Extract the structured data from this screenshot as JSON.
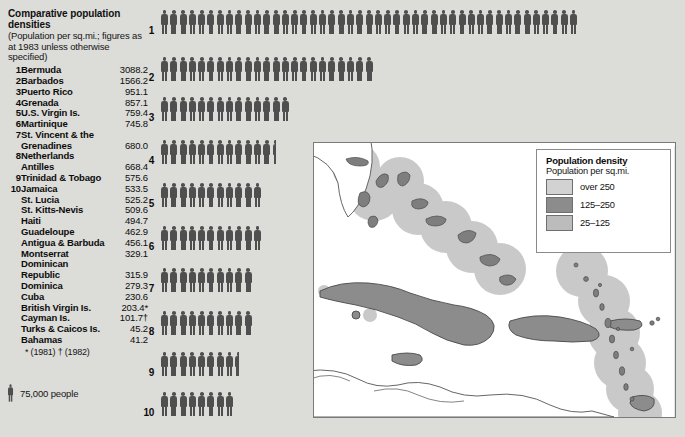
{
  "panel": {
    "title": "Comparative population densities",
    "subtitle": "(Population per sq.mi.; figures as at 1983 unless otherwise specified)",
    "footnote": "* (1981)  † (1982)",
    "key_label": "75,000 people",
    "key_icon": "person-icon"
  },
  "rows": [
    {
      "rank": "1",
      "name": "Bermuda",
      "value": "3088.2"
    },
    {
      "rank": "2",
      "name": "Barbados",
      "value": "1566.2"
    },
    {
      "rank": "3",
      "name": "Puerto Rico",
      "value": "951.1"
    },
    {
      "rank": "4",
      "name": "Grenada",
      "value": "857.1"
    },
    {
      "rank": "5",
      "name": "U.S. Virgin Is.",
      "value": "759.4"
    },
    {
      "rank": "6",
      "name": "Martinique",
      "value": "745.8"
    },
    {
      "rank": "7",
      "name": "St. Vincent & the",
      "value": ""
    },
    {
      "rank": "",
      "name": "Grenadines",
      "value": "680.0"
    },
    {
      "rank": "8",
      "name": "Netherlands",
      "value": ""
    },
    {
      "rank": "",
      "name": "Antilles",
      "value": "668.4"
    },
    {
      "rank": "9",
      "name": "Trinidad & Tobago",
      "value": "575.6"
    },
    {
      "rank": "10",
      "name": "Jamaica",
      "value": "533.5"
    },
    {
      "rank": "",
      "name": "St. Lucia",
      "value": "525.2"
    },
    {
      "rank": "",
      "name": "St. Kitts-Nevis",
      "value": "509.6"
    },
    {
      "rank": "",
      "name": "Haiti",
      "value": "494.7"
    },
    {
      "rank": "",
      "name": "Guadeloupe",
      "value": "462.9"
    },
    {
      "rank": "",
      "name": "Antigua & Barbuda",
      "value": "456.1"
    },
    {
      "rank": "",
      "name": "Montserrat",
      "value": "329.1"
    },
    {
      "rank": "",
      "name": "Dominican",
      "value": ""
    },
    {
      "rank": "",
      "name": "Republic",
      "value": "315.9"
    },
    {
      "rank": "",
      "name": "Dominica",
      "value": "279.3"
    },
    {
      "rank": "",
      "name": "Cuba",
      "value": "230.6"
    },
    {
      "rank": "",
      "name": "British Virgin Is.",
      "value": "203.4*"
    },
    {
      "rank": "",
      "name": "Cayman Is.",
      "value": "101.7†"
    },
    {
      "rank": "",
      "name": "Turks & Caicos Is.",
      "value": "45.2"
    },
    {
      "rank": "",
      "name": "Bahamas",
      "value": "41.2"
    }
  ],
  "chart_data": {
    "type": "bar",
    "title": "Comparative population densities",
    "xlabel": "Population per sq.mi.",
    "ylabel": "",
    "unit_note": "each figure = 75,000 people",
    "symbol": "person-icon",
    "categories": [
      "1",
      "2",
      "3",
      "4",
      "5",
      "6",
      "7",
      "8",
      "9",
      "10"
    ],
    "category_names": [
      "Bermuda",
      "Barbados",
      "Puerto Rico",
      "Grenada",
      "U.S. Virgin Is.",
      "Martinique",
      "St. Vincent & the Grenadines",
      "Netherlands Antilles",
      "Trinidad & Tobago",
      "Jamaica"
    ],
    "values": [
      3088.2,
      1566.2,
      951.1,
      857.1,
      759.4,
      745.8,
      680.0,
      668.4,
      575.6,
      533.5
    ],
    "symbol_counts": [
      45,
      23,
      14,
      12.5,
      11,
      11,
      10,
      10,
      8.5,
      8
    ],
    "grid": false,
    "legend": "none"
  },
  "legend": {
    "title": "Population density",
    "subtitle": "Population per sq.mi.",
    "items": [
      {
        "label": "over 250",
        "color": "#d2d2d2"
      },
      {
        "label": "125–250",
        "color": "#8c8c8c"
      },
      {
        "label": "25–125",
        "color": "#bcbcbc"
      }
    ]
  },
  "map": {
    "name": "caribbean-map",
    "land_fill": "#ffffff",
    "land_stroke": "#555555",
    "dense_fill": "#8c8c8c",
    "halo_fill": "#c9c9c9",
    "background": "#ffffff"
  },
  "colors": {
    "page_background": "#dcdcd9",
    "figure": "#4f4f4f",
    "text": "#0c0c0c"
  }
}
